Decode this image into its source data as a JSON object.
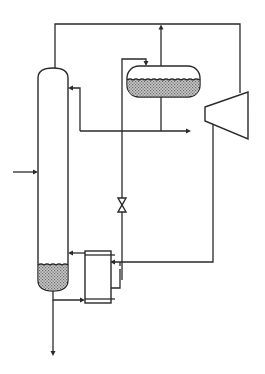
{
  "diagram": {
    "type": "process-flow-diagram",
    "labels": [],
    "colors": {
      "line": "#2a2a2a",
      "background": "#ffffff",
      "liquid_fill": "#9a9a9a"
    },
    "components": [
      {
        "id": "column",
        "kind": "distillation-column"
      },
      {
        "id": "flash-drum",
        "kind": "horizontal-drum"
      },
      {
        "id": "compressor",
        "kind": "compressor"
      },
      {
        "id": "reboiler",
        "kind": "heat-exchanger"
      },
      {
        "id": "throttle-valve",
        "kind": "valve"
      }
    ],
    "streams": [
      {
        "id": "feed",
        "to": "column"
      },
      {
        "id": "overhead-vapor",
        "from": "column",
        "to": "compressor"
      },
      {
        "id": "compressed-vapor",
        "from": "compressor",
        "to": "reboiler"
      },
      {
        "id": "condensate",
        "from": "reboiler",
        "to": "throttle-valve"
      },
      {
        "id": "valve-to-drum",
        "from": "throttle-valve",
        "to": "flash-drum"
      },
      {
        "id": "drum-vapor",
        "from": "flash-drum",
        "to": "overhead-line"
      },
      {
        "id": "drum-liquid",
        "from": "flash-drum",
        "to": "product-and-reflux"
      },
      {
        "id": "reflux",
        "to": "column"
      },
      {
        "id": "distillate",
        "from": "flash-drum",
        "to": "outlet-right"
      },
      {
        "id": "boilup",
        "from": "reboiler",
        "to": "column"
      },
      {
        "id": "bottoms-to-reboiler",
        "from": "column",
        "to": "reboiler"
      },
      {
        "id": "bottoms-product",
        "from": "column",
        "to": "outlet-down"
      }
    ]
  }
}
